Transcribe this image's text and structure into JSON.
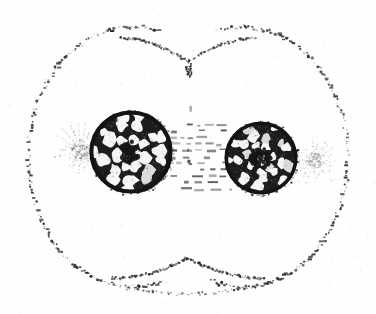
{
  "figure": {
    "caption": "Stippled line drawing of a cell undergoing division, showing two daughter nuclei with reticulate chromatin, two asters, interzonal spindle fibres and a cleavage furrow.",
    "medium": "halftone line engraving",
    "background_color": "#fefefe",
    "ink_color": "#1a1a1a",
    "mid_ink_color": "#6b6b6b",
    "light_ink_color": "#a8a8a8",
    "canvas": {
      "width": 376,
      "height": 314
    }
  },
  "cell_outline": {
    "label": "cell membrane",
    "style": "stippled",
    "stroke_color": "#262626",
    "left_lobe": {
      "cx": 133,
      "cy": 157,
      "rx": 105,
      "ry": 130
    },
    "right_lobe": {
      "cx": 243,
      "cy": 157,
      "rx": 105,
      "ry": 130
    },
    "bounds": {
      "left": 28,
      "right": 350,
      "top": 22,
      "bottom": 292
    },
    "dot_count": 560,
    "dot_min_size": 0.7,
    "dot_max_size": 2.6
  },
  "cleavage_furrow": {
    "label": "cleavage furrow",
    "top_notch": {
      "x": 188,
      "y": 62,
      "depth": 26
    },
    "bottom_notch": {
      "x": 188,
      "y": 258,
      "depth": 28
    },
    "description": "inward V-shaped pinch of the membrane at top and bottom midline"
  },
  "division_axis": {
    "label": "division plane",
    "style": "dashed vertical line",
    "x": 188,
    "top_y": 66,
    "bottom_y": 252,
    "dash_color": "#3a3a3a"
  },
  "nuclei": [
    {
      "name": "left daughter nucleus",
      "cx": 131,
      "cy": 152,
      "r": 41,
      "rim_color": "#141414",
      "rim_width": 4.0,
      "chromatin_style": "reticulate network with pale lacunae",
      "lacuna_count": 26,
      "tone": "dark"
    },
    {
      "name": "right daughter nucleus",
      "cx": 261,
      "cy": 158,
      "r": 36,
      "rim_color": "#141414",
      "rim_width": 3.6,
      "chromatin_style": "reticulate network with pale lacunae",
      "lacuna_count": 24,
      "tone": "dark"
    }
  ],
  "asters": [
    {
      "name": "left aster",
      "cx": 80,
      "cy": 150,
      "radius": 27,
      "ray_count": 22,
      "color": "#8a8a8a",
      "tone": "medium grey"
    },
    {
      "name": "right aster",
      "cx": 314,
      "cy": 160,
      "radius": 25,
      "ray_count": 22,
      "color": "#a0a0a0",
      "tone": "light grey"
    }
  ],
  "spindle": {
    "label": "interzonal spindle fibres",
    "left_x": 172,
    "right_x": 232,
    "top_y": 124,
    "bottom_y": 188,
    "fibre_count": 11,
    "style": "broken horizontal dashes",
    "color": "#4a4a4a"
  },
  "scan_artifacts": {
    "speckle_count": 240,
    "speckle_color": "#9a9a9a",
    "description": "faint halftone noise across the plate"
  }
}
